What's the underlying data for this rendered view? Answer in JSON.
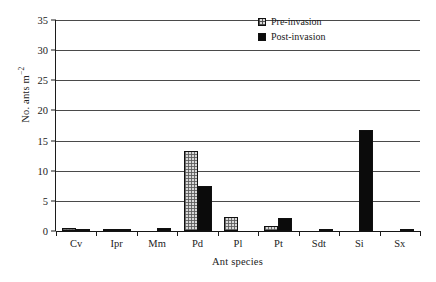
{
  "chart_data": {
    "type": "bar",
    "title": "",
    "xlabel": "Ant species",
    "ylabel_text": "No. ants m",
    "ylabel_exponent": "−2",
    "ylabel": "No. ants m−2",
    "categories": [
      "Cv",
      "Ipr",
      "Mm",
      "Pd",
      "Pl",
      "Pt",
      "Sdt",
      "Si",
      "Sx"
    ],
    "series": [
      {
        "name": "Pre-invasion",
        "values": [
          0.5,
          0.35,
          0.0,
          13.2,
          2.3,
          0.8,
          0.0,
          0.0,
          0.0
        ]
      },
      {
        "name": "Post-invasion",
        "values": [
          0.2,
          0.1,
          0.5,
          7.5,
          0.0,
          2.1,
          0.05,
          16.7,
          0.05
        ]
      }
    ],
    "ylim": [
      0,
      35
    ],
    "yticks": [
      0,
      5,
      10,
      15,
      20,
      25,
      30,
      35
    ],
    "ytick_labels": [
      "0",
      "5",
      "10",
      "15",
      "20",
      "25",
      "30",
      "35"
    ],
    "grid": true,
    "grid_orientation": "horizontal",
    "legend_position": "top-right",
    "colors": {
      "pre_fill": "#d8d8d8",
      "post_fill": "#0b0b0b",
      "outline": "#101010",
      "gridline": "#4a4a4a",
      "axis": "#1c1c1c",
      "background": "#ffffff"
    }
  },
  "legend": {
    "items": [
      {
        "label": "Pre-invasion",
        "swatch": "hatched-square-icon"
      },
      {
        "label": "Post-invasion",
        "swatch": "filled-square-icon"
      }
    ]
  }
}
